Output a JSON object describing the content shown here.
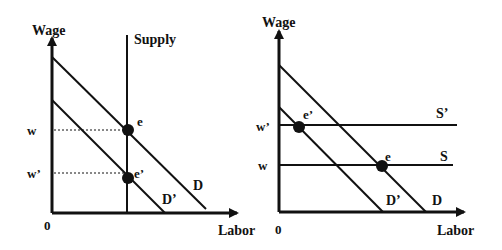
{
  "colors": {
    "ink": "#111111",
    "background": "#ffffff"
  },
  "left_panel": {
    "y_axis_label": "Wage",
    "x_axis_label": "Labor",
    "origin_label": "0",
    "supply_label": "Supply",
    "demand_label": "D",
    "demand_prime_label": "D’",
    "wage_label": "w",
    "wage_prime_label": "w’",
    "eq_label": "e",
    "eq_prime_label": "e’"
  },
  "right_panel": {
    "y_axis_label": "Wage",
    "x_axis_label": "Labor",
    "origin_label": "0",
    "supply_label": "S",
    "supply_prime_label": "S’",
    "demand_label": "D",
    "demand_prime_label": "D’",
    "wage_label": "w",
    "wage_prime_label": "w’",
    "eq_label": "e",
    "eq_prime_label": "e’"
  }
}
